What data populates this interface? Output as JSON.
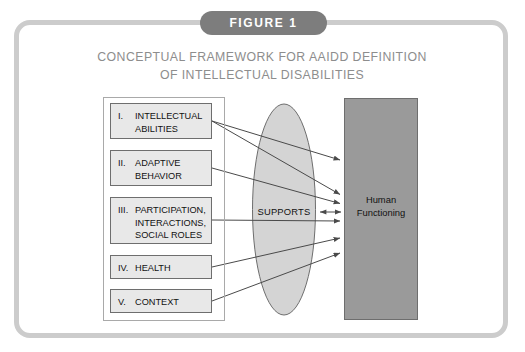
{
  "figure": {
    "banner_label": "FIGURE 1",
    "title_line_1": "CONCEPTUAL FRAMEWORK FOR AAIDD DEFINITION",
    "title_line_2": "OF INTELLECTUAL DISABILITIES"
  },
  "colors": {
    "frame_border": "#cccccc",
    "banner_background": "#7d7d7d",
    "banner_text": "#ffffff",
    "title_text": "#8d8d8d",
    "box_fill": "#e8e8e8",
    "box_border": "#6e6e6e",
    "ellipse_fill": "#d4d4d4",
    "ellipse_border": "#6e6e6e",
    "panel_fill": "#9a9a9a",
    "panel_border": "#6e6e6e",
    "arrow": "#4a4a4a"
  },
  "dimensions": [
    {
      "numeral": "I.",
      "label_line_1": "INTELLECTUAL",
      "label_line_2": "ABILITIES",
      "label_line_3": ""
    },
    {
      "numeral": "II.",
      "label_line_1": "ADAPTIVE",
      "label_line_2": "BEHAVIOR",
      "label_line_3": ""
    },
    {
      "numeral": "III.",
      "label_line_1": "PARTICIPATION,",
      "label_line_2": "INTERACTIONS,",
      "label_line_3": "SOCIAL ROLES"
    },
    {
      "numeral": "IV.",
      "label_line_1": "HEALTH",
      "label_line_2": "",
      "label_line_3": ""
    },
    {
      "numeral": "V.",
      "label_line_1": "CONTEXT",
      "label_line_2": "",
      "label_line_3": ""
    }
  ],
  "mediator": {
    "label": "SUPPORTS"
  },
  "outcome": {
    "label_line_1": "Human",
    "label_line_2": "Functioning"
  }
}
